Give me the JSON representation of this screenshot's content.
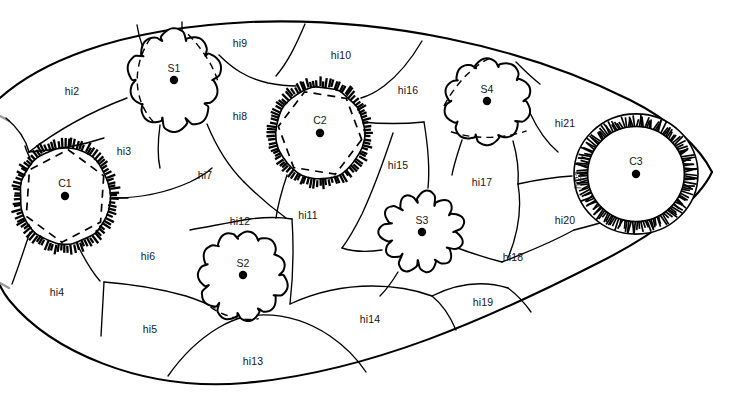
{
  "figure": {
    "kind": "schematic-diagram",
    "background_color": "#ffffff",
    "line_color": "#000000",
    "label_color": "#151515",
    "width": 737,
    "height": 396
  },
  "regions": [
    {
      "id": "hi2",
      "label": "hi2",
      "x": 72,
      "y": 92
    },
    {
      "id": "hi3",
      "label": "hi3",
      "x": 124,
      "y": 152
    },
    {
      "id": "hi4",
      "label": "hi4",
      "x": 57,
      "y": 293
    },
    {
      "id": "hi5",
      "label": "hi5",
      "x": 150,
      "y": 330
    },
    {
      "id": "hi6",
      "label": "hi6",
      "x": 148,
      "y": 257
    },
    {
      "id": "hi7",
      "label": "hi7",
      "x": 205,
      "y": 176
    },
    {
      "id": "hi8",
      "label": "hi8",
      "x": 240,
      "y": 117
    },
    {
      "id": "hi9",
      "label": "hi9",
      "x": 240,
      "y": 44
    },
    {
      "id": "hi10",
      "label": "hi10",
      "x": 341,
      "y": 56
    },
    {
      "id": "hi11",
      "label": "hi11",
      "x": 308,
      "y": 216
    },
    {
      "id": "hi12",
      "label": "hi12",
      "x": 240,
      "y": 222
    },
    {
      "id": "hi13",
      "label": "hi13",
      "x": 253,
      "y": 362
    },
    {
      "id": "hi14",
      "label": "hi14",
      "x": 370,
      "y": 320
    },
    {
      "id": "hi15",
      "label": "hi15",
      "x": 398,
      "y": 166
    },
    {
      "id": "hi16",
      "label": "hi16",
      "x": 408,
      "y": 91
    },
    {
      "id": "hi17",
      "label": "hi17",
      "x": 482,
      "y": 183
    },
    {
      "id": "hi18",
      "label": "hi18",
      "x": 513,
      "y": 258
    },
    {
      "id": "hi19",
      "label": "hi19",
      "x": 483,
      "y": 303
    },
    {
      "id": "hi20",
      "label": "hi20",
      "x": 565,
      "y": 221
    },
    {
      "id": "hi21",
      "label": "hi21",
      "x": 565,
      "y": 124
    },
    {
      "id": "hi22",
      "label": "hi22",
      "x": 578,
      "y": 180,
      "rotated": true
    }
  ],
  "cells": [
    {
      "id": "C1",
      "label": "C1",
      "type": "hatched-ring-dashed-core",
      "cx": 65,
      "cy": 196,
      "r": 50,
      "label_dy": -12
    },
    {
      "id": "C2",
      "label": "C2",
      "type": "hatched-ring-dashed-core",
      "cx": 320,
      "cy": 133,
      "r": 49,
      "label_dy": -12
    },
    {
      "id": "C3",
      "label": "C3",
      "type": "double-ring-hatched",
      "cx": 636,
      "cy": 174,
      "r": 62,
      "label_dy": -12
    },
    {
      "id": "S1",
      "label": "S1",
      "type": "cog-blob-dashed",
      "cx": 174,
      "cy": 80,
      "r": 47,
      "label_dy": -11
    },
    {
      "id": "S2",
      "label": "S2",
      "type": "cog-blob-dashed",
      "cx": 243,
      "cy": 275,
      "r": 45,
      "label_dy": -11
    },
    {
      "id": "S3",
      "label": "S3",
      "type": "cog-blob-plain",
      "cx": 422,
      "cy": 232,
      "r": 43,
      "label_dy": -11
    },
    {
      "id": "S4",
      "label": "S4",
      "type": "cog-blob-dashed",
      "cx": 487,
      "cy": 101,
      "r": 44,
      "label_dy": -11
    }
  ],
  "legend_note": ""
}
